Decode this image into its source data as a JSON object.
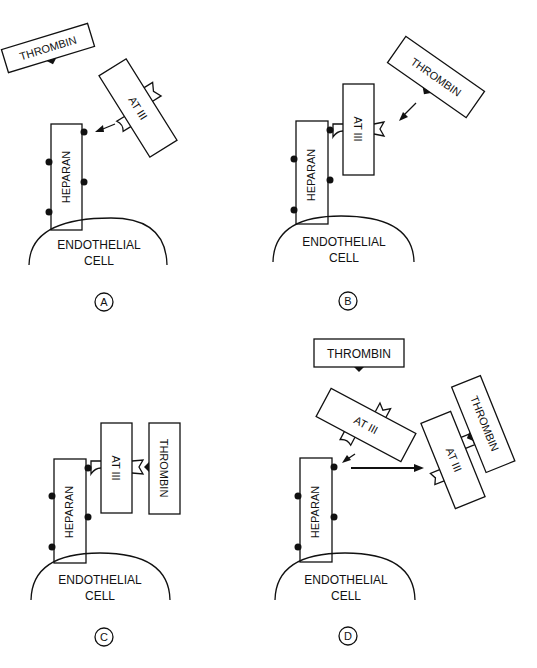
{
  "figure": {
    "labels": {
      "thrombin": "THROMBIN",
      "at3": "AT III",
      "heparan": "HEPARAN",
      "cell_line1": "ENDOTHELIAL",
      "cell_line2": "CELL"
    },
    "panels": [
      {
        "id": "A",
        "label": "A",
        "description": "AT III approaching heparan binding site; thrombin free"
      },
      {
        "id": "B",
        "label": "B",
        "description": "AT III bound to heparan; thrombin approaching AT III"
      },
      {
        "id": "C",
        "label": "C",
        "description": "Thrombin bound to AT III while AT III bound to heparan"
      },
      {
        "id": "D",
        "label": "D",
        "description": "AT III-thrombin complex released from heparan; heparan free again"
      }
    ],
    "colors": {
      "ink": "#111111",
      "background": "#ffffff"
    }
  }
}
